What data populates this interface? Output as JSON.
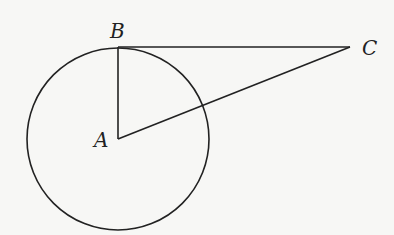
{
  "diagram": {
    "type": "geometry",
    "points": {
      "A": {
        "label": "A",
        "x": 118,
        "y": 139
      },
      "B": {
        "label": "B",
        "x": 118,
        "y": 47
      },
      "C": {
        "label": "C",
        "x": 350,
        "y": 47
      }
    },
    "circle": {
      "center": "A",
      "radius": 91
    },
    "segments": [
      [
        "A",
        "B"
      ],
      [
        "B",
        "C"
      ],
      [
        "A",
        "C"
      ]
    ],
    "stroke_color": "#222222",
    "background": "#f7f7f5"
  },
  "labels": {
    "A": "A",
    "B": "B",
    "C": "C"
  }
}
